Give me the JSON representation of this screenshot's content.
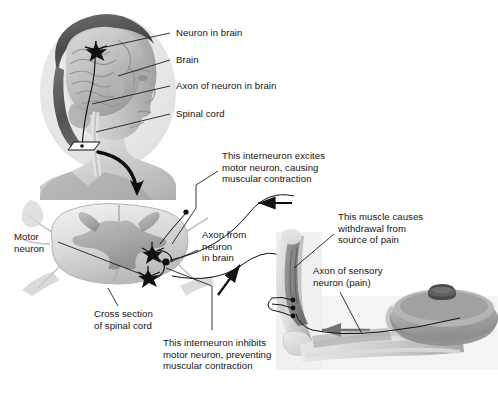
{
  "figure": {
    "background_color": "#ffffff",
    "ink_color": "#141414"
  },
  "labels": {
    "neuron_in_brain": "Neuron in brain",
    "brain": "Brain",
    "axon_of_neuron_in_brain": "Axon of neuron in brain",
    "spinal_cord": "Spinal cord",
    "interneuron_excites": "This interneuron excites\nmotor neuron, causing\nmuscular contraction",
    "motor_neuron": "Motor\nneuron",
    "axon_from_neuron_in_brain": "Axon from\nneuron\nin brain",
    "muscle_withdrawal": "This muscle causes\nwithdrawal from\nsource of pain",
    "axon_of_sensory_neuron": "Axon of sensory\nneuron (pain)",
    "cross_section_of_spinal_cord": "Cross section\nof spinal cord",
    "interneuron_inhibits": "This interneuron inhibits\nmotor neuron, preventing\nmuscular contraction"
  },
  "illustrations": {
    "head": "human-head-profile-with-brain",
    "spinal_cord": "spinal-cord-cross-section-gray-matter-butterfly",
    "arm": "flexed-arm-hand-gripping-hot-pot",
    "pot": "cooking-pot-with-lid-knob"
  },
  "markers": {
    "brain_neuron_star": "star-marker",
    "spinal_neuron_stars": 3,
    "interneuron_dot": "neuron-cell-body-dot",
    "sensory_terminal_dots": 3
  },
  "arrows": {
    "head_to_cross_section": "curved-arrow-down",
    "descending_to_cord": "arrow-up-right",
    "cord_to_arm": "arrow-left-top",
    "pot_to_arm": "arrow-left-bottom"
  }
}
